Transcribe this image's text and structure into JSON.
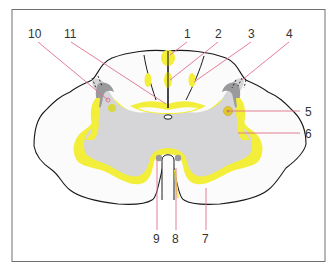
{
  "figure": {
    "colors": {
      "frame": "#707070",
      "outline": "#1a1a1a",
      "gray_matter": "#d6d6d8",
      "dark_gray": "#9a9a9c",
      "tract_yellow": "#f2ee3a",
      "tract_yellow_light": "#f6f07a",
      "leader_line": "#e0708a",
      "white_matter": "#fbfbfb"
    },
    "labels": [
      {
        "id": "1",
        "text": "1",
        "x": 187,
        "y": 38
      },
      {
        "id": "2",
        "text": "2",
        "x": 218,
        "y": 38
      },
      {
        "id": "3",
        "text": "3",
        "x": 251,
        "y": 38
      },
      {
        "id": "4",
        "text": "4",
        "x": 289,
        "y": 38
      },
      {
        "id": "5",
        "text": "5",
        "x": 306,
        "y": 116
      },
      {
        "id": "6",
        "text": "6",
        "x": 306,
        "y": 138
      },
      {
        "id": "7",
        "text": "7",
        "x": 203,
        "y": 242
      },
      {
        "id": "8",
        "text": "8",
        "x": 172,
        "y": 242
      },
      {
        "id": "9",
        "text": "9",
        "x": 153,
        "y": 242
      },
      {
        "id": "10",
        "text": "10",
        "x": 27,
        "y": 38
      },
      {
        "id": "11",
        "text": "11",
        "x": 66,
        "y": 38
      }
    ]
  }
}
